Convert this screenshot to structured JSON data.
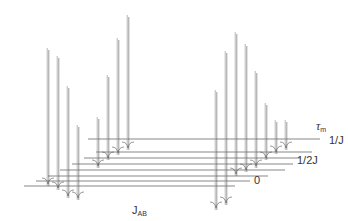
{
  "chart_data": {
    "type": "stacked-line",
    "title": "",
    "axis_label_x": "J_AB",
    "axis_label_stack": "τm",
    "stack_tick_labels": [
      "0",
      "1/2J",
      "1/J"
    ],
    "trace_count": 8,
    "traces": [
      {
        "index": 0,
        "label": "0",
        "baseline_y": 186,
        "x_start": 24,
        "x_end": 235,
        "offset_x": 0
      },
      {
        "index": 1,
        "label": "",
        "baseline_y": 181,
        "x_start": 36,
        "x_end": 250,
        "offset_x": 10
      },
      {
        "index": 2,
        "label": "",
        "baseline_y": 176,
        "x_start": 48,
        "x_end": 268,
        "offset_x": 20
      },
      {
        "index": 3,
        "label": "",
        "baseline_y": 170,
        "x_start": 60,
        "x_end": 285,
        "offset_x": 30
      },
      {
        "index": 4,
        "label": "1/2J",
        "baseline_y": 164,
        "x_start": 72,
        "x_end": 293,
        "offset_x": 40
      },
      {
        "index": 5,
        "label": "",
        "baseline_y": 158,
        "x_start": 84,
        "x_end": 300,
        "offset_x": 50
      },
      {
        "index": 6,
        "label": "",
        "baseline_y": 152,
        "x_start": 96,
        "x_end": 312,
        "offset_x": 60
      },
      {
        "index": 7,
        "label": "1/J",
        "baseline_y": 139,
        "x_start": 88,
        "x_end": 320,
        "offset_x": 70
      }
    ],
    "left_multiplet_peaks": [
      {
        "x": 48,
        "top_y": 48,
        "bottom_y": 186
      },
      {
        "x": 58,
        "top_y": 56,
        "bottom_y": 190
      },
      {
        "x": 68,
        "top_y": 86,
        "bottom_y": 198
      },
      {
        "x": 78,
        "top_y": 125,
        "bottom_y": 200
      },
      {
        "x": 98,
        "top_y": 117,
        "bottom_y": 168
      },
      {
        "x": 108,
        "top_y": 75,
        "bottom_y": 160
      },
      {
        "x": 118,
        "top_y": 38,
        "bottom_y": 155
      },
      {
        "x": 128,
        "top_y": 15,
        "bottom_y": 150
      }
    ],
    "right_multiplet_peaks": [
      {
        "x": 216,
        "top_y": 90,
        "bottom_y": 210
      },
      {
        "x": 226,
        "top_y": 51,
        "bottom_y": 205
      },
      {
        "x": 236,
        "top_y": 32,
        "bottom_y": 176
      },
      {
        "x": 246,
        "top_y": 44,
        "bottom_y": 172
      },
      {
        "x": 256,
        "top_y": 71,
        "bottom_y": 168
      },
      {
        "x": 266,
        "top_y": 103,
        "bottom_y": 160
      },
      {
        "x": 276,
        "top_y": 120,
        "bottom_y": 154
      },
      {
        "x": 286,
        "top_y": 120,
        "bottom_y": 150
      }
    ],
    "colors": {
      "trace": "#555555",
      "peak": "#9a9a9a",
      "text": "#333333"
    }
  },
  "labels": {
    "tau_symbol": "τ",
    "tau_sub": "m",
    "stack_1_over_J": "1/J",
    "stack_half_J": "1/2J",
    "stack_zero": "0",
    "xaxis_main": "J",
    "xaxis_sub": "AB"
  }
}
